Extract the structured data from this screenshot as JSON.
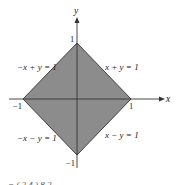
{
  "diagram": {
    "type": "region-plot",
    "axes": {
      "x_label": "x",
      "y_label": "y"
    },
    "ticks": {
      "x_pos": "1",
      "x_neg": "−1",
      "y_pos": "1",
      "y_neg": "−1"
    },
    "edges": {
      "top_right": "x + y = 1",
      "top_left": "−x + y = 1",
      "bottom_left": "−x − y = 1",
      "bottom_right": "x − y = 1"
    },
    "vertices": [
      [
        1,
        0
      ],
      [
        0,
        1
      ],
      [
        -1,
        0
      ],
      [
        0,
        -1
      ]
    ],
    "colors": {
      "fill": "#8c8c8c",
      "stroke": "#333333",
      "axis": "#333333"
    },
    "cut_off_text": "= ( 2        4 )              8              2"
  }
}
